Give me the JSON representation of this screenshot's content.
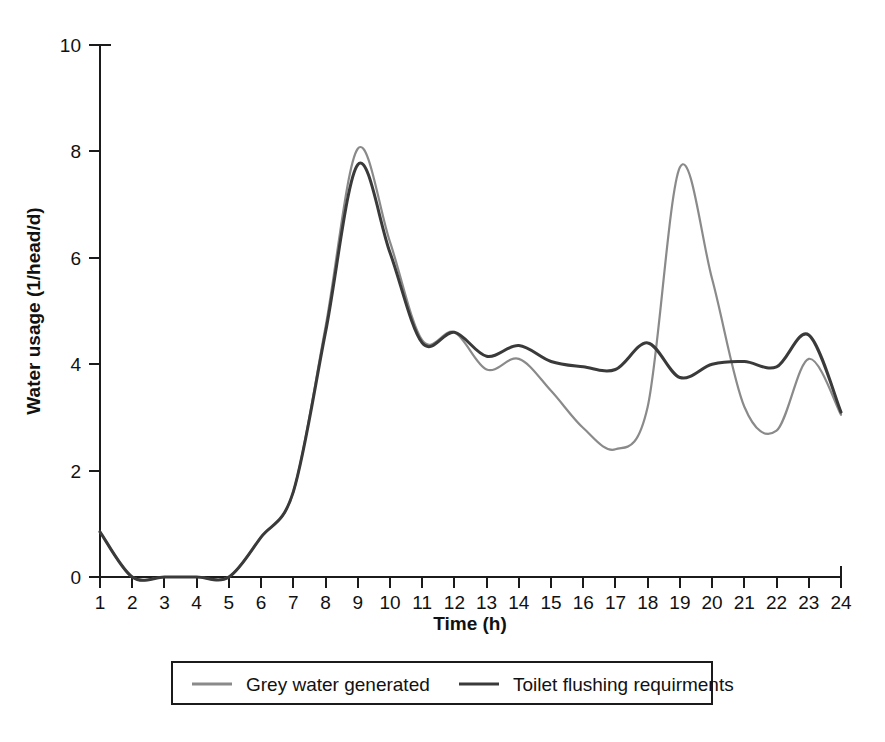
{
  "chart_data": {
    "type": "line",
    "title": "",
    "xlabel": "Time (h)",
    "ylabel": "Water usage (1/head/d)",
    "xlim": [
      1,
      24
    ],
    "ylim": [
      0,
      10
    ],
    "xticks": [
      1,
      2,
      3,
      4,
      5,
      6,
      7,
      8,
      9,
      10,
      11,
      12,
      13,
      14,
      15,
      16,
      17,
      18,
      19,
      20,
      21,
      22,
      23,
      24
    ],
    "yticks": [
      0,
      2,
      4,
      6,
      8,
      10
    ],
    "xtick_labels": [
      "1",
      "2",
      "3",
      "4",
      "5",
      "6",
      "7",
      "8",
      "9",
      "10",
      "11",
      "12",
      "13",
      "14",
      "15",
      "16",
      "17",
      "18",
      "19",
      "20",
      "21",
      "22",
      "23",
      "24"
    ],
    "ytick_labels": [
      "0",
      "2",
      "4",
      "6",
      "8",
      "10"
    ],
    "grid": false,
    "legend_position": "bottom",
    "x": [
      1,
      2,
      3,
      4,
      5,
      6,
      7,
      8,
      9,
      10,
      11,
      12,
      13,
      14,
      15,
      16,
      17,
      18,
      19,
      20,
      21,
      22,
      23,
      24
    ],
    "series": [
      {
        "name": "Grey water generated",
        "color": "#8a8a8a",
        "values": [
          0.85,
          0.0,
          0.0,
          0.0,
          0.0,
          0.75,
          1.6,
          4.7,
          8.05,
          6.3,
          4.45,
          4.6,
          3.9,
          4.1,
          3.5,
          2.8,
          2.4,
          3.2,
          7.7,
          5.6,
          3.2,
          2.75,
          4.1,
          3.05
        ]
      },
      {
        "name": "Toilet flushing requirments",
        "color": "#3a3a3a",
        "values": [
          0.85,
          0.0,
          0.0,
          0.0,
          0.0,
          0.75,
          1.6,
          4.6,
          7.75,
          6.1,
          4.4,
          4.6,
          4.15,
          4.35,
          4.05,
          3.95,
          3.9,
          4.4,
          3.75,
          4.0,
          4.05,
          3.95,
          4.55,
          3.1
        ]
      }
    ],
    "annotations": []
  },
  "axes": {
    "y_axis_title": "Water usage (1/head/d)",
    "x_axis_title": "Time (h)"
  },
  "legend": {
    "entries": [
      {
        "label": "Grey water generated",
        "color": "#8a8a8a"
      },
      {
        "label": "Toilet flushing requirments",
        "color": "#3a3a3a"
      }
    ]
  },
  "colors": {
    "grey_series": "#8a8a8a",
    "dark_series": "#3a3a3a",
    "axis": "#1b1b1b",
    "background": "#ffffff"
  }
}
